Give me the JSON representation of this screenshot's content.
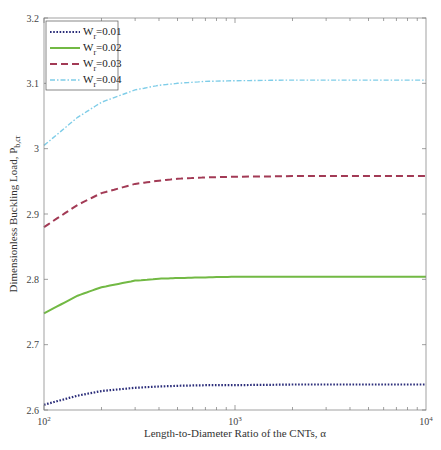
{
  "chart_data": {
    "type": "line",
    "title": "",
    "xlabel": "Length-to-Diameter Ratio of the CNTs, α",
    "ylabel": "Dimensionless Buckling Load, P",
    "ylabel_subscript": "b,cr",
    "xscale": "log",
    "xlim": [
      100,
      10000
    ],
    "ylim": [
      2.6,
      3.2
    ],
    "grid": false,
    "legend_position": "upper left",
    "x_ticks": [
      {
        "base": "10",
        "exp": "2",
        "value": 100
      },
      {
        "base": "10",
        "exp": "3",
        "value": 1000
      },
      {
        "base": "10",
        "exp": "4",
        "value": 10000
      }
    ],
    "y_ticks": [
      "2.6",
      "2.7",
      "2.8",
      "2.9",
      "3",
      "3.1",
      "3.2"
    ],
    "x": [
      100,
      150,
      200,
      300,
      400,
      500,
      700,
      1000,
      2000,
      5000,
      10000
    ],
    "series": [
      {
        "name": "W",
        "subscript": "r",
        "value_label": "=0.01",
        "style": "dotted",
        "color": "#2b2d7a",
        "values": [
          2.608,
          2.622,
          2.629,
          2.634,
          2.636,
          2.637,
          2.638,
          2.638,
          2.639,
          2.639,
          2.639
        ]
      },
      {
        "name": "W",
        "subscript": "r",
        "value_label": "=0.02",
        "style": "solid",
        "color": "#72b944",
        "values": [
          2.748,
          2.775,
          2.788,
          2.798,
          2.801,
          2.802,
          2.803,
          2.804,
          2.804,
          2.804,
          2.804
        ]
      },
      {
        "name": "W",
        "subscript": "r",
        "value_label": "=0.03",
        "style": "dashed",
        "color": "#a23a55",
        "values": [
          2.88,
          2.914,
          2.932,
          2.946,
          2.951,
          2.954,
          2.956,
          2.957,
          2.958,
          2.958,
          2.958
        ]
      },
      {
        "name": "W",
        "subscript": "r",
        "value_label": "=0.04",
        "style": "dashdot",
        "color": "#7fcde8",
        "values": [
          3.005,
          3.048,
          3.071,
          3.09,
          3.097,
          3.1,
          3.103,
          3.104,
          3.105,
          3.105,
          3.105
        ]
      }
    ]
  }
}
